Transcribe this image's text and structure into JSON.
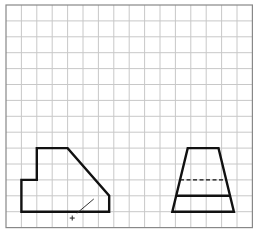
{
  "figure": {
    "type": "orthographic-drawing",
    "grid": {
      "columns": 16,
      "rows": 14,
      "origin_px": [
        6,
        5
      ],
      "cell_px": [
        15.4,
        15.9
      ],
      "line_color": "#c8c8c8",
      "border_color": "#888888"
    },
    "views": [
      {
        "name": "front-view",
        "shape": "pentagon-with-step",
        "vertices_grid": [
          [
            1,
            11
          ],
          [
            2,
            11
          ],
          [
            2,
            9
          ],
          [
            4,
            9
          ],
          [
            6.7,
            12
          ],
          [
            6.7,
            13
          ],
          [
            1,
            13
          ]
        ],
        "line_color": "#111111",
        "center_mark": "+",
        "center_mark_grid": [
          4.3,
          13.4
        ],
        "leader_line": {
          "from_grid": [
            4.6,
            13.1
          ],
          "to_grid": [
            5.7,
            12.2
          ]
        }
      },
      {
        "name": "side-view",
        "shape": "trapezoid",
        "vertices_grid": [
          [
            11.8,
            9
          ],
          [
            13.8,
            9
          ],
          [
            14.8,
            13
          ],
          [
            10.8,
            13
          ]
        ],
        "line_color": "#111111",
        "solid_line_grid_y": 12,
        "hidden_line_grid_y": 11,
        "hidden_line_style": "dashed"
      }
    ]
  }
}
